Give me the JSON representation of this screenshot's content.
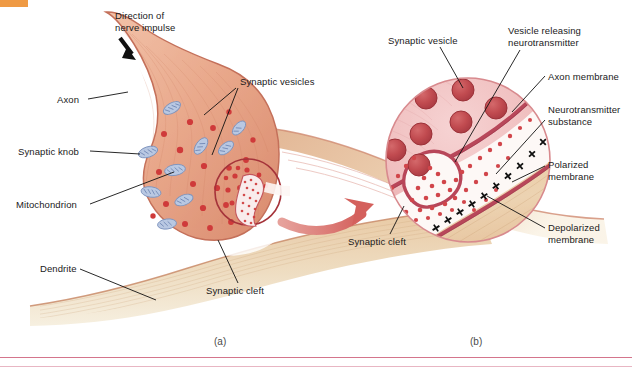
{
  "figure": {
    "title_domain": "neuron synapse anatomical diagram",
    "panels": [
      {
        "id": "a",
        "label": "(a)",
        "x": 214,
        "y": 336
      },
      {
        "id": "b",
        "label": "(b)",
        "x": 470,
        "y": 336
      }
    ],
    "accent_orange": "#ef9a44",
    "rule_color": "#d4758c",
    "membrane_color": "#b8475a",
    "cytoplasm_color": "#e8a98c",
    "vesicle_color": "#cf3a3a",
    "mitochondria_color": "#8da4cc",
    "dendrite_color": "#e4c9a4",
    "arrow_color": "#d9736f"
  },
  "panel_a": {
    "labels": [
      {
        "name": "direction-of-nerve-impulse",
        "text": "Direction of\nnerve impulse",
        "x": 115,
        "y": 10
      },
      {
        "name": "axon",
        "text": "Axon",
        "x": 57,
        "y": 95
      },
      {
        "name": "synaptic-knob",
        "text": "Synaptic knob",
        "x": 18,
        "y": 147
      },
      {
        "name": "mitochondrion",
        "text": "Mitochondrion",
        "x": 17,
        "y": 200
      },
      {
        "name": "dendrite",
        "text": "Dendrite",
        "x": 40,
        "y": 265
      },
      {
        "name": "synaptic-vesicles",
        "text": "Synaptic vesicles",
        "x": 240,
        "y": 77
      },
      {
        "name": "synaptic-cleft",
        "text": "Synaptic cleft",
        "x": 207,
        "y": 287
      }
    ]
  },
  "panel_b": {
    "labels": [
      {
        "name": "synaptic-vesicle",
        "text": "Synaptic vesicle",
        "x": 388,
        "y": 36
      },
      {
        "name": "vesicle-releasing-neurotransmitter",
        "text": "Vesicle releasing\nneurotransmitter",
        "x": 508,
        "y": 26
      },
      {
        "name": "axon-membrane",
        "text": "Axon membrane",
        "x": 547,
        "y": 72
      },
      {
        "name": "neurotransmitter-substance",
        "text": "Neurotransmitter\nsubstance",
        "x": 547,
        "y": 105
      },
      {
        "name": "polarized-membrane",
        "text": "Polarized\nmembrane",
        "x": 547,
        "y": 160
      },
      {
        "name": "depolarized-membrane",
        "text": "Depolarized\nmembrane",
        "x": 547,
        "y": 223
      },
      {
        "name": "synaptic-cleft",
        "text": "Synaptic cleft",
        "x": 348,
        "y": 238
      }
    ]
  }
}
